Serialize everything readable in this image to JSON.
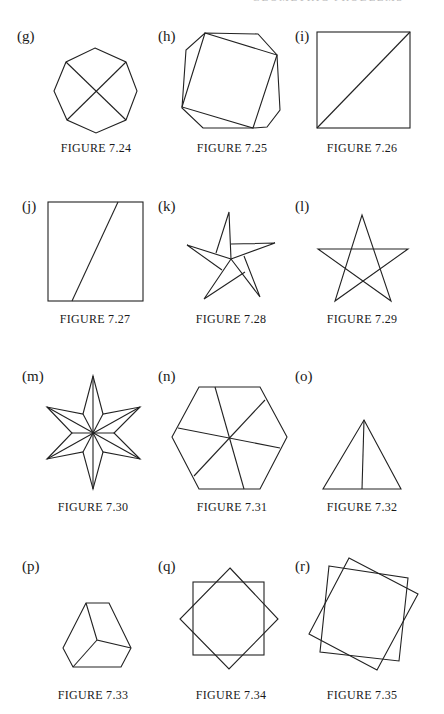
{
  "page": {
    "running_header": "GEOMETRIC PROBLEMS    ·  ·  ·"
  },
  "figures": [
    {
      "label": "(g)",
      "caption": "FIGURE 7.24",
      "shape": "octagon with two diagonals"
    },
    {
      "label": "(h)",
      "caption": "FIGURE 7.25",
      "shape": "octagon with inscribed rotated square"
    },
    {
      "label": "(i)",
      "caption": "FIGURE 7.26",
      "shape": "square with one diagonal"
    },
    {
      "label": "(j)",
      "caption": "FIGURE 7.27",
      "shape": "square cut by slanted line"
    },
    {
      "label": "(k)",
      "caption": "FIGURE 7.28",
      "shape": "pinwheel five-pointed star"
    },
    {
      "label": "(l)",
      "caption": "FIGURE 7.29",
      "shape": "pentagram"
    },
    {
      "label": "(m)",
      "caption": "FIGURE 7.30",
      "shape": "six-pointed faceted star"
    },
    {
      "label": "(n)",
      "caption": "FIGURE 7.31",
      "shape": "hexagon divided by three lines"
    },
    {
      "label": "(o)",
      "caption": "FIGURE 7.32",
      "shape": "triangle with median"
    },
    {
      "label": "(p)",
      "caption": "FIGURE 7.33",
      "shape": "cube-like hexagon"
    },
    {
      "label": "(q)",
      "caption": "FIGURE 7.34",
      "shape": "square and 45-degree rotated square"
    },
    {
      "label": "(r)",
      "caption": "FIGURE 7.35",
      "shape": "two overlapping tilted squares"
    }
  ]
}
